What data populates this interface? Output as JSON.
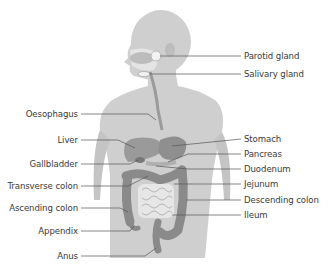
{
  "diagram": {
    "colors": {
      "body": "#cfcfcf",
      "body_dark": "#bdbdbd",
      "organ": "#9a9a9a",
      "organ_dark": "#8a8a8a",
      "intestine_light": "#e6e6e6",
      "leader_line": "#555555",
      "text": "#3a3a3a"
    },
    "labels_right": [
      {
        "text": "Parotid gland",
        "x": 244,
        "y": 51
      },
      {
        "text": "Salivary gland",
        "x": 244,
        "y": 67
      },
      {
        "text": "Stomach",
        "x": 244,
        "y": 134
      },
      {
        "text": "Pancreas",
        "x": 244,
        "y": 149
      },
      {
        "text": "Duodenum",
        "x": 244,
        "y": 164
      },
      {
        "text": "Jejunum",
        "x": 244,
        "y": 179
      },
      {
        "text": "Descending colon",
        "x": 244,
        "y": 195
      },
      {
        "text": "Ileum",
        "x": 244,
        "y": 210
      }
    ],
    "labels_left": [
      {
        "text": "Oesophagus",
        "right": 78,
        "y": 109
      },
      {
        "text": "Liver",
        "right": 78,
        "y": 135
      },
      {
        "text": "Gallbladder",
        "right": 78,
        "y": 159
      },
      {
        "text": "Transverse colon",
        "right": 78,
        "y": 181
      },
      {
        "text": "Ascending colon",
        "right": 78,
        "y": 203
      },
      {
        "text": "Appendix",
        "right": 78,
        "y": 226
      },
      {
        "text": "Anus",
        "right": 78,
        "y": 250
      }
    ]
  }
}
